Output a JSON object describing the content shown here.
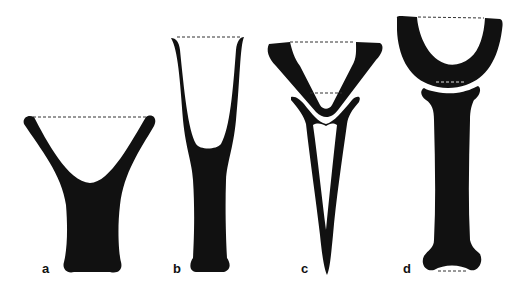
{
  "figure": {
    "fill_color": "#111111",
    "dash_color": "#333333",
    "panels": [
      {
        "label": "a",
        "shape": "broad Y / funnel with V-shaped opening"
      },
      {
        "label": "b",
        "shape": "tall narrow Y / funnel with U-shaped opening"
      },
      {
        "label": "c",
        "shape": "inverted triangle cup resting in long V / spike"
      },
      {
        "label": "d",
        "shape": "U-shaped cup resting on bone-shaped shaft"
      }
    ]
  }
}
